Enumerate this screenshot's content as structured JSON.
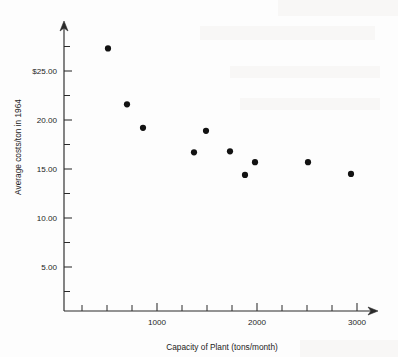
{
  "chart_data": {
    "type": "scatter",
    "title": "",
    "xlabel": "Capacity of Plant (tons/month)",
    "ylabel": "Average costs/ton in 1964",
    "xlim": [
      70,
      3070
    ],
    "ylim": [
      0.5,
      29.5
    ],
    "grid": false,
    "legend": null,
    "xticks": [
      {
        "value": 250,
        "label": ""
      },
      {
        "value": 500,
        "label": ""
      },
      {
        "value": 750,
        "label": ""
      },
      {
        "value": 1000,
        "label": "1000"
      },
      {
        "value": 1250,
        "label": ""
      },
      {
        "value": 1500,
        "label": ""
      },
      {
        "value": 1750,
        "label": ""
      },
      {
        "value": 2000,
        "label": "2000"
      },
      {
        "value": 2250,
        "label": ""
      },
      {
        "value": 2500,
        "label": ""
      },
      {
        "value": 2750,
        "label": ""
      },
      {
        "value": 3000,
        "label": "3000"
      }
    ],
    "yticks": [
      {
        "value": 2.5,
        "label": ""
      },
      {
        "value": 5.0,
        "label": "5.00"
      },
      {
        "value": 7.5,
        "label": ""
      },
      {
        "value": 10.0,
        "label": "10.00"
      },
      {
        "value": 12.5,
        "label": ""
      },
      {
        "value": 15.0,
        "label": "15.00"
      },
      {
        "value": 17.5,
        "label": ""
      },
      {
        "value": 20.0,
        "label": "20.00"
      },
      {
        "value": 22.5,
        "label": ""
      },
      {
        "value": 25.0,
        "label": "$25.00"
      },
      {
        "value": 27.5,
        "label": ""
      }
    ],
    "points": [
      {
        "x": 510,
        "y": 27.3
      },
      {
        "x": 700,
        "y": 21.6
      },
      {
        "x": 860,
        "y": 19.2
      },
      {
        "x": 1370,
        "y": 16.7
      },
      {
        "x": 1490,
        "y": 18.9
      },
      {
        "x": 1730,
        "y": 16.8
      },
      {
        "x": 1880,
        "y": 14.4
      },
      {
        "x": 1980,
        "y": 15.7
      },
      {
        "x": 2510,
        "y": 15.7
      },
      {
        "x": 2940,
        "y": 14.5
      }
    ],
    "marker": {
      "shape": "circle",
      "radius_px": 3.1,
      "color": "#121212"
    },
    "axis_color": "#2b2b2b",
    "background_color": "#fdfdfd"
  }
}
